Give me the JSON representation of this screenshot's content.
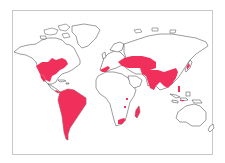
{
  "map": {
    "type": "world-distribution-map",
    "projection": "equirectangular-like",
    "colors": {
      "range_fill": "#f0305a",
      "land_fill": "#ffffff",
      "coastline": "#3a3a3a",
      "frame": "#c8c8c8",
      "background": "#ffffff"
    },
    "distribution_regions": [
      "eastern-north-america",
      "mexico-central-america",
      "south-america",
      "southern-europe-mediterranean",
      "central-asia",
      "south-asia-india",
      "east-asia-china",
      "japan",
      "philippines",
      "madagascar",
      "southern-africa",
      "east-africa-spots",
      "indonesia-spots"
    ]
  }
}
